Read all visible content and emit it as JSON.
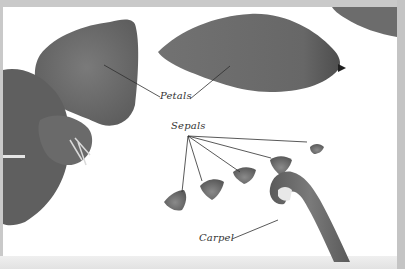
{
  "figure": {
    "colors": {
      "border": "#c9c9c9",
      "background": "#ffffff",
      "petal": "#6f6f6f",
      "petal_dark": "#555555",
      "leader_line": "#2f2f2f",
      "label_text": "#333333"
    },
    "labels": [
      {
        "id": "petals",
        "text": "Petals",
        "x": 160,
        "y": 90
      },
      {
        "id": "sepals",
        "text": "Sepals",
        "x": 171,
        "y": 120
      },
      {
        "id": "carpel",
        "text": "Carpel",
        "x": 199,
        "y": 232
      }
    ]
  }
}
